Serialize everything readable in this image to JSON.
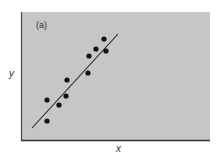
{
  "chart_data": {
    "type": "scatter",
    "title": "",
    "panel_label": "(a)",
    "xlabel": "x",
    "ylabel": "y",
    "grid": false,
    "legend": null,
    "xlim": [
      0,
      189
    ],
    "ylim": [
      0,
      128
    ],
    "points": [
      {
        "x": 26,
        "y": 40
      },
      {
        "x": 26,
        "y": 19
      },
      {
        "x": 38,
        "y": 35
      },
      {
        "x": 45,
        "y": 44
      },
      {
        "x": 46,
        "y": 60
      },
      {
        "x": 67,
        "y": 67
      },
      {
        "x": 68,
        "y": 84
      },
      {
        "x": 75,
        "y": 91
      },
      {
        "x": 83,
        "y": 101
      },
      {
        "x": 85,
        "y": 89
      }
    ],
    "fit_line": {
      "x1": 11,
      "y1": 12,
      "x2": 97,
      "y2": 106
    },
    "colors": {
      "panel_background": "#c6c6c6",
      "points": "#111111",
      "line": "#222222",
      "axis": "#333333"
    }
  }
}
